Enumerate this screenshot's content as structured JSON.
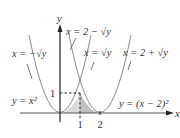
{
  "diagram": {
    "axes": {
      "x_label": "x",
      "y_label": "y",
      "x_ticks": [
        "1",
        "2"
      ],
      "y_ticks": [
        "1"
      ]
    },
    "curves": [
      {
        "name": "left-parabola",
        "equation": "y = x²",
        "inverse_labels": [
          "x = −√y",
          "x = √y"
        ]
      },
      {
        "name": "right-parabola",
        "equation": "y = (x − 2)²",
        "inverse_labels": [
          "x = 2 − √y",
          "x = 2 + √y"
        ]
      }
    ],
    "labels": {
      "x_eq_neg_sqrt_y": "x = −√y",
      "x_eq_2_minus_sqrt_y": "x = 2 − √y",
      "x_eq_sqrt_y": "x = √y",
      "x_eq_2_plus_sqrt_y": "x = 2 + √y",
      "y_eq_x2": "y = x²",
      "y_eq_x_minus_2_sq": "y = (x − 2)²"
    },
    "shaded_region": {
      "description": "Region between y = x² and y = (x − 2)² above x-axis, from x = 0 to x = 2, peak at (1, 1)",
      "vertices": [
        [
          0,
          0
        ],
        [
          1,
          1
        ],
        [
          2,
          0
        ]
      ]
    },
    "colors": {
      "curve": "#8a8a8a",
      "axis": "#222222",
      "shade_light": "#d9d9d9",
      "shade_dark": "#bdbdbd"
    }
  }
}
